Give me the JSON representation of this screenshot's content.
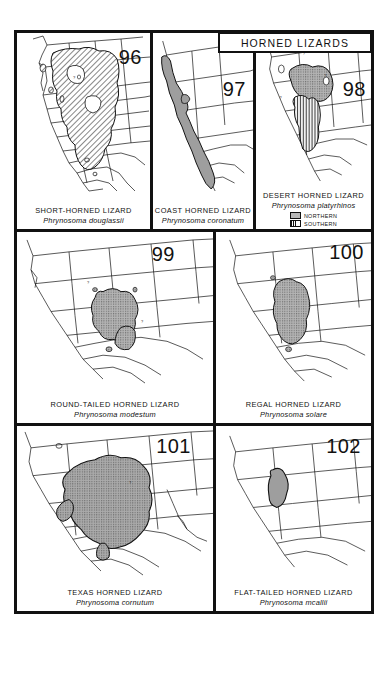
{
  "plate": {
    "header_title": "HORNED LIZARDS"
  },
  "legend": {
    "northern_label": "NORTHERN",
    "southern_label": "SOUTHERN",
    "northern_swatch": "stipple-swatch",
    "southern_swatch": "vertical-hatch-swatch"
  },
  "colors": {
    "ink": "#111111",
    "paper": "#ffffff",
    "range_fill": "#9e9e9e",
    "stipple_fill": "#b8b8b8"
  },
  "panels": [
    {
      "number": "96",
      "common_name": "SHORT-HORNED LIZARD",
      "scientific_name": "Phrynosoma douglassii",
      "fill_style": "diagonal-hatch"
    },
    {
      "number": "97",
      "common_name": "COAST HORNED LIZARD",
      "scientific_name": "Phrynosoma coronatum",
      "fill_style": "solid-gray"
    },
    {
      "number": "98",
      "common_name": "DESERT HORNED LIZARD",
      "scientific_name": "Phrynosoma platyrhinos",
      "fill_style": "stipple-and-hatch",
      "has_legend": true
    },
    {
      "number": "99",
      "common_name": "ROUND-TAILED HORNED LIZARD",
      "scientific_name": "Phrynosoma modestum",
      "fill_style": "stipple"
    },
    {
      "number": "100",
      "common_name": "REGAL HORNED LIZARD",
      "scientific_name": "Phrynosoma solare",
      "fill_style": "stipple"
    },
    {
      "number": "101",
      "common_name": "TEXAS HORNED LIZARD",
      "scientific_name": "Phrynosoma cornutum",
      "fill_style": "stipple"
    },
    {
      "number": "102",
      "common_name": "FLAT-TAILED HORNED LIZARD",
      "scientific_name": "Phrynosoma mcallii",
      "fill_style": "solid-gray"
    }
  ]
}
